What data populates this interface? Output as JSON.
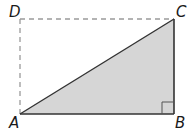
{
  "diagram": {
    "type": "rectangle-with-right-triangle",
    "points": {
      "A": {
        "label": "A",
        "x": 20,
        "y": 114
      },
      "B": {
        "label": "B",
        "x": 174,
        "y": 114
      },
      "C": {
        "label": "C",
        "x": 174,
        "y": 19
      },
      "D": {
        "label": "D",
        "x": 20,
        "y": 19
      }
    },
    "triangle": [
      "A",
      "B",
      "C"
    ],
    "dashed_sides": [
      "AD",
      "DC"
    ],
    "right_angle_at": "B",
    "colors": {
      "fill": "#d6d6d6",
      "stroke": "#333333",
      "dashed": "#9a9a9a"
    }
  }
}
